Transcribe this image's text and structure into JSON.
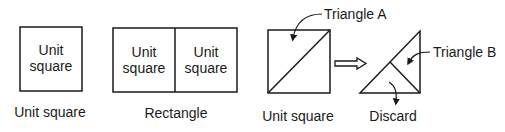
{
  "panel1": {
    "inner_label_line1": "Unit",
    "inner_label_line2": "square",
    "caption": "Unit square"
  },
  "panel2": {
    "left_label_line1": "Unit",
    "left_label_line2": "square",
    "right_label_line1": "Unit",
    "right_label_line2": "square",
    "caption": "Rectangle"
  },
  "panel3": {
    "callout": "Triangle A",
    "caption": "Unit square"
  },
  "panel4": {
    "callout": "Triangle B",
    "caption": "Discard"
  },
  "colors": {
    "stroke": "#1a1a1a",
    "background": "#ffffff"
  }
}
